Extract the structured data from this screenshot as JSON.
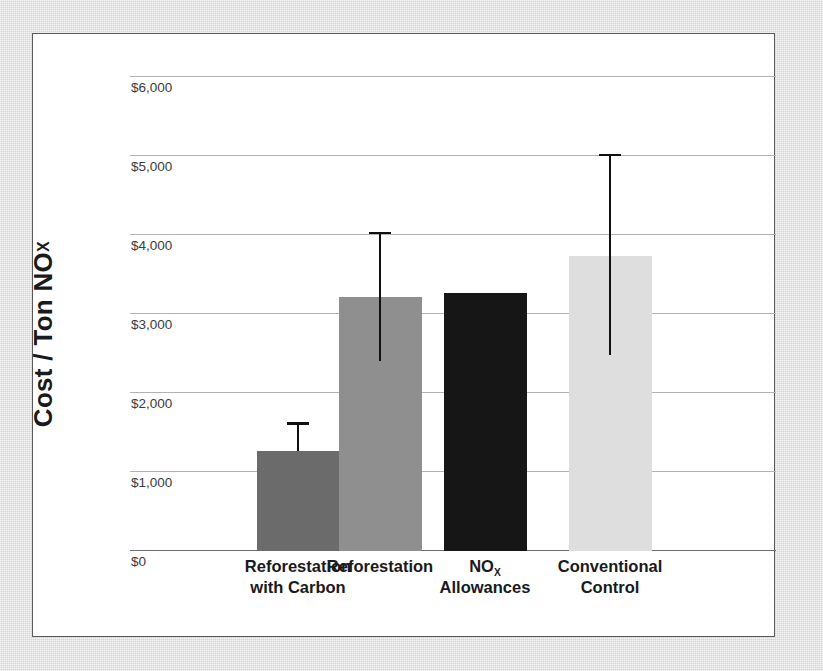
{
  "chart_data": {
    "type": "bar",
    "title": "",
    "xlabel": "",
    "ylabel": "Cost / Ton NOx",
    "ylabel_parts": {
      "main": "Cost / Ton NO",
      "subscript": "X"
    },
    "ylim": [
      0,
      6000
    ],
    "grid": true,
    "legend": "none",
    "y_ticks": [
      0,
      1000,
      2000,
      3000,
      4000,
      5000,
      6000
    ],
    "y_tick_labels": [
      "$0",
      "$1,000",
      "$2,000",
      "$3,000",
      "$4,000",
      "$5,000",
      "$6,000"
    ],
    "categories": [
      "Reforestation with Carbon",
      "Reforestation",
      "NOx Allowances",
      "Conventional Control"
    ],
    "category_label_lines": [
      [
        "Reforestation",
        "with Carbon"
      ],
      [
        "Reforestation"
      ],
      [
        "NO",
        "Allowances"
      ],
      [
        "Conventional",
        "Control"
      ]
    ],
    "values": [
      1270,
      3210,
      3270,
      3730
    ],
    "error_low": [
      1270,
      2400,
      3270,
      2480
    ],
    "error_high": [
      1600,
      4010,
      3270,
      5000
    ],
    "bar_colors": [
      "#6b6b6b",
      "#8f8f8f",
      "#161616",
      "#dedede"
    ],
    "error_bar_color": "#111111",
    "bars": [
      {
        "category": "Reforestation with Carbon",
        "value": 1270,
        "error_low": 1270,
        "error_high": 1600,
        "color": "#6b6b6b",
        "has_error_bar": true,
        "label_lines": [
          "Reforestation",
          "with Carbon"
        ],
        "subscript": ""
      },
      {
        "category": "Reforestation",
        "value": 3210,
        "error_low": 2400,
        "error_high": 4010,
        "color": "#8f8f8f",
        "has_error_bar": true,
        "label_lines": [
          "Reforestation"
        ],
        "subscript": ""
      },
      {
        "category": "NOx Allowances",
        "value": 3270,
        "error_low": 3270,
        "error_high": 3270,
        "color": "#161616",
        "has_error_bar": false,
        "label_lines": [
          "NO",
          "Allowances"
        ],
        "subscript": "X"
      },
      {
        "category": "Conventional Control",
        "value": 3730,
        "error_low": 2480,
        "error_high": 5000,
        "color": "#dedede",
        "has_error_bar": true,
        "label_lines": [
          "Conventional",
          "Control"
        ],
        "subscript": ""
      }
    ]
  },
  "figure": {
    "background_color": "#ffffff",
    "border_color": "#5a5a5a",
    "page_background": "#d9d9d9",
    "gridline_color": "#b3b3b3",
    "axis_color": "#6f6f6f"
  }
}
